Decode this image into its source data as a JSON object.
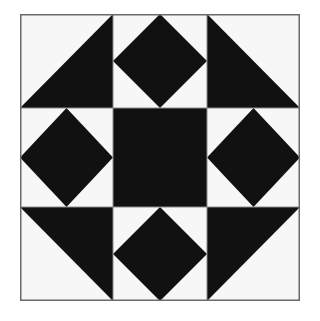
{
  "title": "Quilt block",
  "colors": {
    "dark": "#111111",
    "light": "#f7f7f7",
    "border": "#6a6a6a",
    "grid": "#8a8a8a"
  },
  "grid": {
    "rows": 3,
    "cols": 3
  },
  "cells": [
    {
      "row": 0,
      "col": 0,
      "type": "half-square-triangle",
      "dark_half": "bottom-right"
    },
    {
      "row": 0,
      "col": 1,
      "type": "square-in-square",
      "center": "dark",
      "corners": "light"
    },
    {
      "row": 0,
      "col": 2,
      "type": "half-square-triangle",
      "dark_half": "bottom-left"
    },
    {
      "row": 1,
      "col": 0,
      "type": "square-in-square",
      "center": "dark",
      "corners": "light"
    },
    {
      "row": 1,
      "col": 1,
      "type": "solid",
      "fill": "dark"
    },
    {
      "row": 1,
      "col": 2,
      "type": "square-in-square",
      "center": "dark",
      "corners": "light"
    },
    {
      "row": 2,
      "col": 0,
      "type": "half-square-triangle",
      "dark_half": "top-right"
    },
    {
      "row": 2,
      "col": 1,
      "type": "square-in-square",
      "center": "dark",
      "corners": "light"
    },
    {
      "row": 2,
      "col": 2,
      "type": "half-square-triangle",
      "dark_half": "top-left"
    }
  ]
}
